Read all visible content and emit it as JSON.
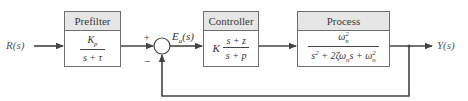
{
  "diagram": {
    "type": "feedback-control-block-diagram",
    "input_label": "R(s)",
    "output_label": "Y(s)",
    "summing_junction": {
      "plus_sign": "+",
      "minus_sign": "−",
      "error_label": "E",
      "error_subscript": "a",
      "error_suffix": "(s)"
    },
    "blocks": [
      {
        "title": "Prefilter",
        "numerator": "K",
        "numerator_subscript": "p",
        "denominator": "s + τ"
      },
      {
        "title": "Controller",
        "gain": "K",
        "numerator": "s + z",
        "denominator": "s + p"
      },
      {
        "title": "Process",
        "numerator_base": "ω",
        "numerator_sub": "n",
        "numerator_sup": "2",
        "denominator_parts": {
          "s": "s",
          "s_sup": "2",
          "middle": " + 2ζω",
          "middle_sub": "n",
          "middle_tail": "s + ω",
          "tail_sub": "n",
          "tail_sup": "2"
        }
      }
    ],
    "feedback": "unity negative feedback",
    "colors": {
      "line": "#444444",
      "box_border": "#6e6e6e",
      "header_fill": "#e6e6e6",
      "text": "#333333"
    }
  }
}
